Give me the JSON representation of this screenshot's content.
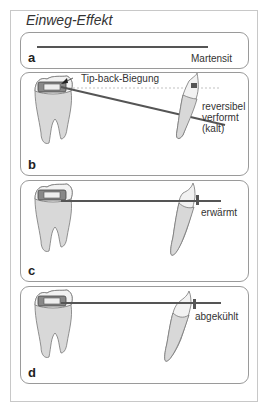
{
  "figure": {
    "title": "Einweg-Effekt",
    "panels": [
      {
        "id": "a",
        "label": "a",
        "annotation": "Martensit"
      },
      {
        "id": "b",
        "label": "b",
        "callout": "Tip-back-Biegung",
        "annotation_line1": "reversibel",
        "annotation_line2": "verformt (kalt)"
      },
      {
        "id": "c",
        "label": "c",
        "annotation": "erwärmt"
      },
      {
        "id": "d",
        "label": "d",
        "annotation": "abgekühlt"
      }
    ],
    "colors": {
      "wire": "#555555",
      "tooth_root_fill": "#d8d8d8",
      "tooth_crown_fill": "#f2f2f2",
      "outline": "#777777",
      "panel_border": "#9a9a9a",
      "frame_border": "#c8c8c8"
    }
  }
}
